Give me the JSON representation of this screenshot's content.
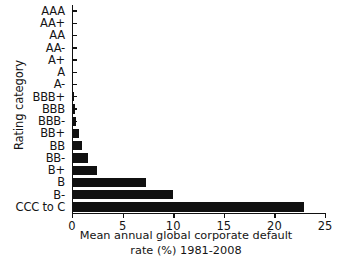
{
  "chart_data": {
    "type": "bar",
    "orientation": "horizontal",
    "title": "",
    "xlabel_line1": "Mean annual global corporate default",
    "xlabel_line2": "rate (%) 1981-2008",
    "ylabel": "Rating category",
    "categories": [
      "AAA",
      "AA+",
      "AA",
      "AA-",
      "A+",
      "A",
      "A-",
      "BBB+",
      "BBB",
      "BBB-",
      "BB+",
      "BB",
      "BB-",
      "B+",
      "B",
      "B-",
      "CCC to C"
    ],
    "values": [
      0,
      0,
      0,
      0,
      0,
      0,
      0,
      0.1,
      0.2,
      0.3,
      0.6,
      0.9,
      1.5,
      2.4,
      7.2,
      9.9,
      22.8
    ],
    "xlim": [
      0,
      25
    ],
    "ylim_note": "categorical",
    "xticks": [
      0,
      5,
      10,
      15,
      20,
      25
    ],
    "xticklabels": [
      "0",
      "5",
      "10",
      "15",
      "20",
      "25"
    ],
    "grid": false,
    "legend": false,
    "bar_color": "#101010"
  }
}
